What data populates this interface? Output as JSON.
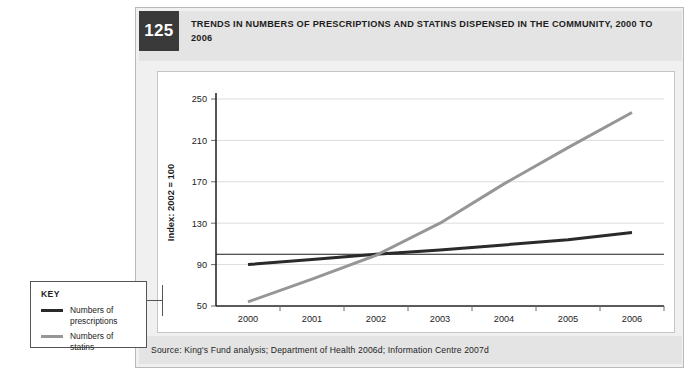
{
  "figure": {
    "number": "125",
    "title": "TRENDS IN NUMBERS OF PRESCRIPTIONS AND STATINS DISPENSED IN THE COMMUNITY, 2000 TO 2006",
    "source": "Source: King's Fund analysis; Department of Health 2006d; Information Centre 2007d"
  },
  "key": {
    "heading": "KEY",
    "entries": [
      {
        "label": "Numbers of prescriptions",
        "color": "#2a2a2a"
      },
      {
        "label": "Numbers of statins",
        "color": "#969696"
      }
    ]
  },
  "chart_data": {
    "type": "line",
    "title": "TRENDS IN NUMBERS OF PRESCRIPTIONS AND STATINS DISPENSED IN THE COMMUNITY, 2000 TO 2006",
    "xlabel": "Year",
    "ylabel": "Index: 2002 = 100",
    "categories": [
      "2000",
      "2001",
      "2002",
      "2003",
      "2004",
      "2005",
      "2006"
    ],
    "x": [
      2000,
      2001,
      2002,
      2003,
      2004,
      2005,
      2006
    ],
    "ylim": [
      50,
      250
    ],
    "yticks": [
      50,
      90,
      130,
      170,
      210,
      250
    ],
    "grid": true,
    "legend_position": "outside-left",
    "reference_line": {
      "value": 100,
      "label": "",
      "color": "#1d1d1d"
    },
    "series": [
      {
        "name": "Numbers of prescriptions",
        "color": "#2a2a2a",
        "values": [
          90,
          95,
          100,
          104,
          109,
          114,
          121
        ]
      },
      {
        "name": "Numbers of statins",
        "color": "#969696",
        "values": [
          54,
          76,
          99,
          130,
          168,
          203,
          237
        ]
      }
    ]
  }
}
